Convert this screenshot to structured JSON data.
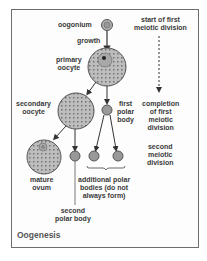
{
  "title": "Oogenesis",
  "labels": {
    "oogonium": "oogonium",
    "growth": "growth",
    "primary_oocyte": [
      "primary",
      "oocyte"
    ],
    "secondary_oocyte": [
      "secondary",
      "oocyte"
    ],
    "first_polar_body": [
      "first",
      "polar",
      "body"
    ],
    "mature_ovum": [
      "mature",
      "ovum"
    ],
    "second_polar_body": [
      "second",
      "polar body"
    ],
    "additional_polar_bodies": [
      "additional polar",
      "bodies (do not",
      "always form)"
    ]
  },
  "timeline": {
    "start": [
      "start of first",
      "meiotic division"
    ],
    "completion": [
      "completion",
      "of first",
      "meiotic",
      "division"
    ],
    "second": [
      "second",
      "meiotic",
      "division"
    ]
  },
  "colors": {
    "cell_fill": "#b8b8b8",
    "cell_stroke": "#555555",
    "text": "#3a3a3a",
    "border": "#6e6e6e"
  }
}
